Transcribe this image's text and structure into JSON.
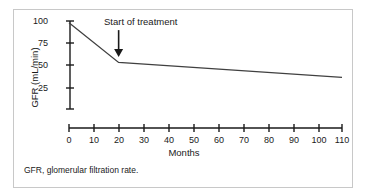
{
  "figure": {
    "footnote": "GFR, glomerular filtration rate.",
    "border_color": "#c8c8c8",
    "background": "#ffffff"
  },
  "chart_data": {
    "type": "line",
    "title": "",
    "xlabel": "Months",
    "ylabel": "GFR (mL/min)",
    "xlim": [
      0,
      110
    ],
    "ylim": [
      0,
      100
    ],
    "grid": false,
    "legend": "none",
    "line_color": "#404040",
    "axis_color": "#1a1a1a",
    "x_ticks": [
      0,
      10,
      20,
      30,
      40,
      50,
      60,
      70,
      80,
      90,
      100,
      110
    ],
    "x_tick_labels": [
      "0",
      "10",
      "20",
      "30",
      "40",
      "50",
      "60",
      "70",
      "80",
      "90",
      "100",
      "110"
    ],
    "y_ticks": [
      25,
      50,
      75,
      100
    ],
    "y_tick_labels": [
      "25",
      "50",
      "75",
      "100"
    ],
    "series": [
      {
        "name": "GFR",
        "x": [
          0,
          20,
          110
        ],
        "values": [
          98,
          53,
          36
        ]
      }
    ],
    "annotations": [
      {
        "text": "Start of treatment",
        "type": "arrow-down",
        "x": 20,
        "arrow_top_y": 76,
        "arrow_tip_y": 59
      }
    ]
  }
}
